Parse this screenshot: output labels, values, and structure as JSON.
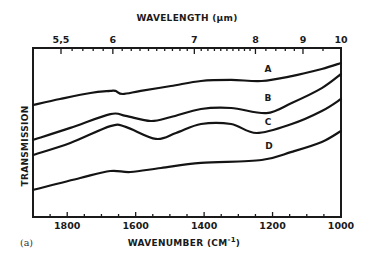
{
  "chart_data": {
    "type": "line",
    "title": "",
    "panel_label": "(a)",
    "xlabel": "WAVENUMBER (CM-1)",
    "xlabel_main": "WAVENUMBER (CM",
    "xlabel_sup": "-1",
    "xlabel_close": ")",
    "x2label": "WAVELENGTH (μm)",
    "ylabel": "TRANSMISSION",
    "xlim": [
      1900,
      1000
    ],
    "ylim": [
      0,
      100
    ],
    "y_units": "relative (arbitrary, no tick labels)",
    "grid": false,
    "legend": "inline curve labels A, B, C, D at right",
    "x_ticks": [
      1800,
      1600,
      1400,
      1200,
      1000
    ],
    "x_minor_step": 50,
    "x2_ticks": [
      5.5,
      6,
      7,
      8,
      9,
      10
    ],
    "x2_minor": [
      5.6,
      5.7,
      5.8,
      5.9,
      6.1,
      6.2,
      6.3,
      6.4,
      6.5,
      6.6,
      6.7,
      6.8,
      6.9,
      7.1,
      7.2,
      7.3,
      7.4,
      7.5,
      7.6,
      7.7,
      7.8,
      7.9,
      8.2,
      8.4,
      8.6,
      8.8,
      9.5
    ],
    "series": [
      {
        "name": "A",
        "x": [
          1900,
          1821,
          1732,
          1674,
          1659,
          1638,
          1585,
          1497,
          1409,
          1321,
          1232,
          1144,
          1056,
          1000
        ],
        "y": [
          66.3,
          69.8,
          73.4,
          74.6,
          74.6,
          72.8,
          74.6,
          77.5,
          80.5,
          81.1,
          80.5,
          83.4,
          87.6,
          91.1
        ]
      },
      {
        "name": "B",
        "x": [
          1900,
          1791,
          1674,
          1629,
          1556,
          1497,
          1409,
          1321,
          1218,
          1144,
          1056,
          1000
        ],
        "y": [
          45.6,
          52.7,
          60.9,
          59.8,
          56.8,
          59.2,
          63.9,
          64.5,
          61.5,
          67.5,
          76.3,
          84.6
        ]
      },
      {
        "name": "C",
        "x": [
          1900,
          1791,
          1674,
          1629,
          1541,
          1482,
          1409,
          1321,
          1247,
          1144,
          1056,
          1000
        ],
        "y": [
          36.7,
          43.8,
          53.8,
          53.3,
          46.2,
          49.7,
          55.0,
          55.0,
          49.7,
          55.0,
          62.7,
          69.8
        ]
      },
      {
        "name": "D",
        "x": [
          1900,
          1762,
          1674,
          1615,
          1526,
          1409,
          1232,
          1144,
          1056,
          1000
        ],
        "y": [
          16.0,
          23.1,
          27.2,
          26.6,
          29.0,
          32.0,
          33.7,
          38.5,
          44.4,
          50.9
        ]
      }
    ],
    "annotations": [
      "A",
      "B",
      "C",
      "D"
    ]
  }
}
